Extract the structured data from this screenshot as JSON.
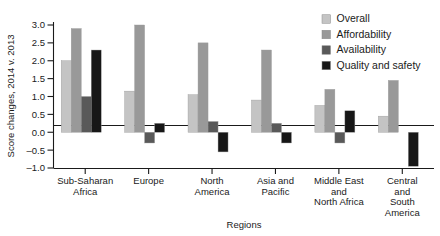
{
  "chart_data": {
    "type": "bar",
    "title": "",
    "xlabel": "Regions",
    "ylabel": "Score changes, 2014 v. 2013",
    "ylim": [
      -1.0,
      3.0
    ],
    "yticks": [
      -1.0,
      -0.5,
      0.0,
      0.5,
      1.0,
      1.5,
      2.0,
      2.5,
      3.0
    ],
    "ytick_labels": [
      "-1.0",
      "-0.5",
      "0.0",
      "0.5",
      "1.0",
      "1.5",
      "2.0",
      "2.5",
      "3.0"
    ],
    "grid": false,
    "legend_position": "top-right",
    "categories": [
      "Sub-Saharan Africa",
      "Europe",
      "North America",
      "Asia and Pacific",
      "Middle East and North Africa",
      "Central and South America"
    ],
    "category_label_lines": [
      [
        "Sub-Saharan",
        "Africa"
      ],
      [
        "Europe"
      ],
      [
        "North",
        "America"
      ],
      [
        "Asia and",
        "Pacific"
      ],
      [
        "Middle East",
        "and",
        "North Africa"
      ],
      [
        "Central",
        "and",
        "South",
        "America"
      ]
    ],
    "series": [
      {
        "name": "Overall",
        "color": "#c4c4c4",
        "values": [
          2.0,
          1.15,
          1.05,
          0.9,
          0.75,
          0.45
        ]
      },
      {
        "name": "Affordability",
        "color": "#999999",
        "values": [
          2.9,
          3.0,
          2.5,
          2.3,
          1.2,
          1.45
        ]
      },
      {
        "name": "Availability",
        "color": "#595959",
        "values": [
          1.0,
          -0.3,
          0.3,
          0.25,
          -0.3,
          0.0
        ]
      },
      {
        "name": "Quality and safety",
        "color": "#171717",
        "values": [
          2.3,
          0.25,
          -0.55,
          -0.3,
          0.6,
          -0.95
        ]
      }
    ]
  },
  "legend": {
    "items": [
      {
        "label": "Overall",
        "color": "#c4c4c4"
      },
      {
        "label": "Affordability",
        "color": "#999999"
      },
      {
        "label": "Availability",
        "color": "#595959"
      },
      {
        "label": "Quality and safety",
        "color": "#171717"
      }
    ]
  }
}
